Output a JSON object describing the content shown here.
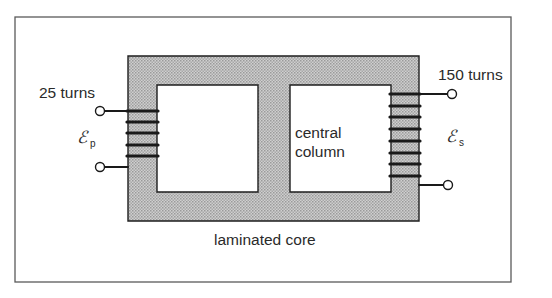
{
  "diagram": {
    "type": "transformer",
    "labels": {
      "primary_turns": "25 turns",
      "secondary_turns": "150 turns",
      "central_column_line1": "central",
      "central_column_line2": "column",
      "core": "laminated core",
      "primary_emf_symbol": "ℰ",
      "primary_emf_subscript": "p",
      "secondary_emf_symbol": "ℰ",
      "secondary_emf_subscript": "s"
    },
    "primary_coil": {
      "visible_windings": 5
    },
    "secondary_coil": {
      "visible_windings": 8
    },
    "colors": {
      "core_fill": "#bdbdbd",
      "stroke": "#1e1e1e",
      "frame": "#5a5a5a",
      "background": "#ffffff"
    }
  }
}
